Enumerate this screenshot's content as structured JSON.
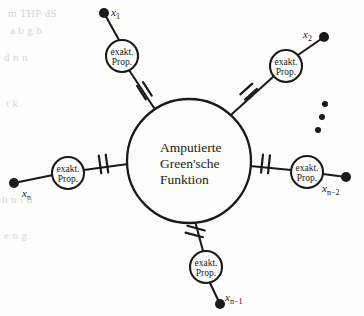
{
  "figure": {
    "kind": "feynman-amputated-green-function-diagram",
    "background_color": "#fdfdfb",
    "ink_color": "#1a1a1a",
    "bleed_color": "#d9d6d0",
    "center_blob": {
      "label_line1": "Amputierte",
      "label_line2": "Green'sche",
      "label_line3": "Funktion",
      "cx": 189,
      "cy": 161,
      "r": 62
    },
    "propagators": [
      {
        "id": "prop-x1",
        "label_line1": "exakt.",
        "label_line2": "Prop.",
        "cx": 122,
        "cy": 56,
        "r": 16
      },
      {
        "id": "prop-x2",
        "label_line1": "exakt.",
        "label_line2": "Prop.",
        "cx": 286,
        "cy": 66,
        "r": 16
      },
      {
        "id": "prop-xn",
        "label_line1": "exakt.",
        "label_line2": "Prop.",
        "cx": 68,
        "cy": 173,
        "r": 16
      },
      {
        "id": "prop-xn2",
        "label_line1": "exakt.",
        "label_line2": "Prop.",
        "cx": 307,
        "cy": 172,
        "r": 16
      },
      {
        "id": "prop-xn1",
        "label_line1": "exakt.",
        "label_line2": "Prop.",
        "cx": 206,
        "cy": 267,
        "r": 16
      }
    ],
    "external_points": [
      {
        "id": "x1",
        "base": "x",
        "subscript": "1",
        "dot_x": 104,
        "dot_y": 13,
        "label_x": 111,
        "label_y": 16
      },
      {
        "id": "x2",
        "base": "x",
        "subscript": "2",
        "dot_x": 324,
        "dot_y": 37,
        "label_x": 303,
        "label_y": 38
      },
      {
        "id": "xn2",
        "base": "x",
        "subscript": "n−2",
        "dot_x": 346,
        "dot_y": 177,
        "label_x": 322,
        "label_y": 192
      },
      {
        "id": "xn1",
        "base": "x",
        "subscript": "n−1",
        "dot_x": 220,
        "dot_y": 304,
        "label_x": 225,
        "label_y": 301
      },
      {
        "id": "xn",
        "base": "x",
        "subscript": "n",
        "dot_x": 14,
        "dot_y": 183,
        "label_x": 22,
        "label_y": 197
      }
    ],
    "ellipsis": {
      "label": "vertical-dots",
      "dots": [
        {
          "x": 325,
          "y": 104
        },
        {
          "x": 322,
          "y": 117
        },
        {
          "x": 318,
          "y": 130
        }
      ]
    },
    "amputation_ticks": [
      {
        "id": "tick-x1",
        "x": 144,
        "y": 91
      },
      {
        "id": "tick-x2",
        "x": 249,
        "y": 92
      },
      {
        "id": "tick-xn",
        "x": 104,
        "y": 164
      },
      {
        "id": "tick-xn2",
        "x": 266,
        "y": 164
      },
      {
        "id": "tick-xn1",
        "x": 195,
        "y": 232
      }
    ],
    "bleed_through_lines": [
      {
        "text": "m THP dS",
        "x": 8,
        "y": 14
      },
      {
        "text": "a b g b",
        "x": 10,
        "y": 31
      },
      {
        "text": "d n n",
        "x": 4,
        "y": 58
      },
      {
        "text": "t k",
        "x": 6,
        "y": 104
      },
      {
        "text": "h n i d",
        "x": 2,
        "y": 200
      },
      {
        "text": "e n g",
        "x": 4,
        "y": 236
      }
    ]
  }
}
